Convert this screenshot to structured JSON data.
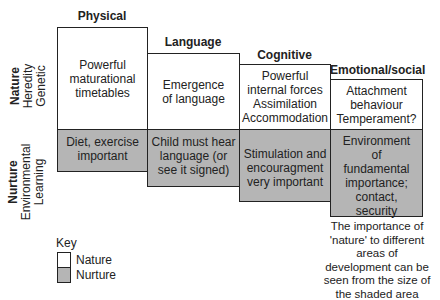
{
  "columns": [
    {
      "title": "Physical",
      "nature": "Powerful maturational timetables",
      "nurture": "Diet, exercise important"
    },
    {
      "title": "Language",
      "nature": "Emergence of language",
      "nurture": "Child must hear language (or see it signed)"
    },
    {
      "title": "Cognitive",
      "nature": "Powerful internal forces Assimilation Accommodation",
      "nurture": "Stimulation and encouragment very important"
    },
    {
      "title": "Emotional/social",
      "nature": "Attachment behaviour Temperament?",
      "nurture": "Environment of fundamental importance; contact, security"
    }
  ],
  "row_labels": {
    "nature": {
      "main": "Nature",
      "sub1": "Heredity",
      "sub2": "Genetic"
    },
    "nurture": {
      "main": "Nurture",
      "sub1": "Environmental",
      "sub2": "Learning"
    }
  },
  "key": {
    "title": "Key",
    "nature": "Nature",
    "nurture": "Nurture"
  },
  "note": "The importance of 'nature' to different areas of development can be seen from the size of the shaded area",
  "colors": {
    "nature": "#ffffff",
    "nurture": "#b5b5b5",
    "border": "#222222"
  }
}
